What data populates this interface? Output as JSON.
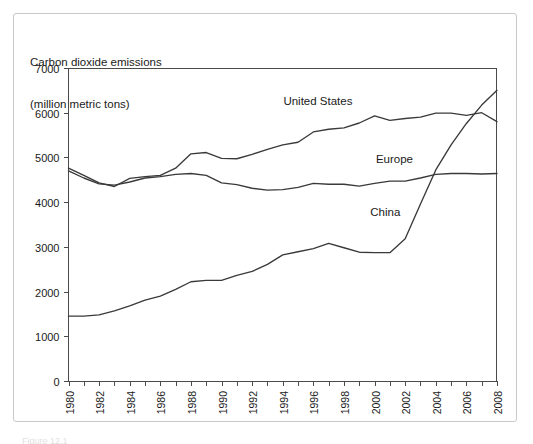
{
  "figure": {
    "title_line1": "Carbon dioxide emissions",
    "title_line2": "(million metric tons)",
    "caption": "Figure 12.1"
  },
  "chart_data": {
    "type": "line",
    "title": "Carbon dioxide emissions (million metric tons)",
    "xlabel": "",
    "ylabel": "million metric tons",
    "xlim": [
      1980,
      2008
    ],
    "ylim": [
      0,
      7000
    ],
    "ytick_values": [
      0,
      1000,
      2000,
      3000,
      4000,
      5000,
      6000,
      7000
    ],
    "ytick_labels": [
      "0",
      "1000",
      "2000",
      "3000",
      "4000",
      "5000",
      "6000",
      "7000"
    ],
    "xtick_values": [
      1980,
      1982,
      1984,
      1986,
      1988,
      1990,
      1992,
      1994,
      1996,
      1998,
      2000,
      2002,
      2004,
      2006,
      2008
    ],
    "xtick_labels": [
      "1980",
      "1982",
      "1984",
      "1986",
      "1988",
      "1990",
      "1992",
      "1994",
      "1996",
      "1998",
      "2000",
      "2002",
      "2004",
      "2006",
      "2008"
    ],
    "minor_xticks_every": 1,
    "grid": false,
    "legend": "inline-labels",
    "x": [
      1980,
      1981,
      1982,
      1983,
      1984,
      1985,
      1986,
      1987,
      1988,
      1989,
      1990,
      1991,
      1992,
      1993,
      1994,
      1995,
      1996,
      1997,
      1998,
      1999,
      2000,
      2001,
      2002,
      2003,
      2004,
      2005,
      2006,
      2007,
      2008
    ],
    "series": [
      {
        "name": "United States",
        "label": "United States",
        "label_x": 1996.3,
        "label_y": 6180,
        "color": "#3a3a3a",
        "values": [
          4760,
          4600,
          4430,
          4350,
          4530,
          4570,
          4600,
          4760,
          5080,
          5110,
          4980,
          4970,
          5070,
          5180,
          5280,
          5340,
          5570,
          5630,
          5660,
          5770,
          5930,
          5830,
          5870,
          5900,
          5990,
          5990,
          5940,
          6000,
          5800
        ]
      },
      {
        "name": "Europe",
        "label": "Europe",
        "label_x": 2001.3,
        "label_y": 4880,
        "color": "#5a5a5a",
        "values": [
          4700,
          4540,
          4410,
          4380,
          4450,
          4540,
          4570,
          4620,
          4640,
          4600,
          4430,
          4390,
          4310,
          4270,
          4280,
          4330,
          4420,
          4400,
          4400,
          4360,
          4420,
          4470,
          4470,
          4540,
          4620,
          4640,
          4640,
          4630,
          4640
        ]
      },
      {
        "name": "China",
        "label": "China",
        "label_x": 2000.7,
        "label_y": 3680,
        "color": "#5a5a5a",
        "values": [
          1450,
          1450,
          1480,
          1570,
          1680,
          1810,
          1900,
          2050,
          2220,
          2250,
          2250,
          2360,
          2450,
          2610,
          2820,
          2890,
          2960,
          3080,
          2980,
          2880,
          2870,
          2870,
          3180,
          3960,
          4720,
          5280,
          5760,
          6170,
          6500
        ]
      }
    ]
  }
}
